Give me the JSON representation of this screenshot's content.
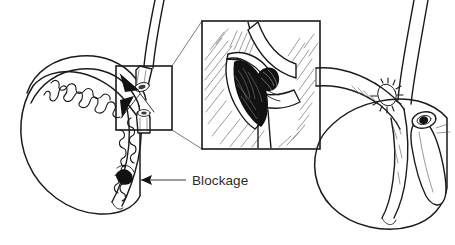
{
  "figure": {
    "type": "medical-line-illustration",
    "background_color": "#ffffff",
    "ink_color": "#1a1a1a",
    "width": 455,
    "height": 245
  },
  "annotations": {
    "blockage_label": "Blockage"
  },
  "callout": {
    "source_box": {
      "x": 116,
      "y": 66,
      "width": 56,
      "height": 64
    },
    "detail_box": {
      "x": 202,
      "y": 21,
      "width": 118,
      "height": 128
    }
  },
  "panels": {
    "left": {
      "name": "blocked-side",
      "parts": [
        "testis",
        "epididymis-cutaway",
        "coiled-tubule",
        "severed-duct-upper",
        "severed-duct-lower",
        "blockage-mass"
      ]
    },
    "right": {
      "name": "repaired-side",
      "parts": [
        "testis",
        "epididymis",
        "vas-deferens",
        "suture-ring",
        "cut-duct-end"
      ]
    },
    "inset": {
      "name": "magnified-blockage-detail",
      "parts": [
        "tissue-hatching",
        "opened-duct-lumen",
        "crossing-duct",
        "blockage-mass"
      ]
    }
  },
  "colors": {
    "ink": "#1a1a1a",
    "hatch": "#4a4a4a",
    "solid_dark": "#121212",
    "label": "#2b2b2b",
    "leader": "#3b3b3b",
    "paper": "#ffffff"
  }
}
